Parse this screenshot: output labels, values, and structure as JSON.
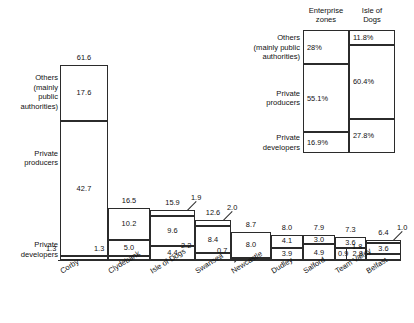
{
  "chart_data": {
    "type": "bar",
    "subtype": "stacked-bar-variable-width",
    "title": "",
    "xlabel": "",
    "ylabel": "",
    "grid": false,
    "legend_position": "top-right",
    "categories": [
      "Corby",
      "Clydebank",
      "Isle of Dogs",
      "Swansea",
      "Newcastle",
      "Dudley",
      "Salford",
      "Team Valley",
      "Belfast"
    ],
    "series": [
      {
        "name": "Others (mainly public authorities)",
        "values": [
          17.6,
          10.2,
          9.6,
          8.4,
          8.0,
          4.1,
          3.0,
          3.6,
          3.6
        ]
      },
      {
        "name": "Private producers",
        "values": [
          42.7,
          5.0,
          4.4,
          2.2,
          0.7,
          3.9,
          4.9,
          0.9,
          1.8
        ]
      },
      {
        "name": "Private developers",
        "values": [
          1.3,
          1.3,
          1.9,
          2.0,
          0.0,
          0.0,
          0.0,
          2.8,
          1.0
        ]
      }
    ],
    "totals": [
      61.6,
      16.5,
      15.9,
      12.6,
      8.7,
      8.0,
      7.9,
      7.3,
      6.4
    ],
    "ylim": [
      0,
      61.6
    ]
  },
  "row_labels": {
    "others": "Others\n(mainly\npublic\nauthorities)",
    "producers": "Private\nproducers",
    "developers": "Private\ndevelopers"
  },
  "bars": [
    {
      "name": "Corby",
      "total": "61.6",
      "segments": [
        {
          "key": "others",
          "label": "17.6",
          "value": 17.6,
          "inline": true
        },
        {
          "key": "producers",
          "label": "42.7",
          "value": 42.7,
          "inline": true
        },
        {
          "key": "developers",
          "label": "1.3",
          "value": 1.3,
          "inline": false
        }
      ]
    },
    {
      "name": "Clydebank",
      "total": "16.5",
      "segments": [
        {
          "key": "others",
          "label": "10.2",
          "value": 10.2,
          "inline": true
        },
        {
          "key": "producers",
          "label": "5.0",
          "value": 5.0,
          "inline": true
        },
        {
          "key": "developers",
          "label": "1.3",
          "value": 1.3,
          "inline": false
        }
      ]
    },
    {
      "name": "Isle of Dogs",
      "total": "15.9",
      "segments": [
        {
          "key": "developers",
          "label": "1.9",
          "value": 1.9,
          "inline": false
        },
        {
          "key": "others",
          "label": "9.6",
          "value": 9.6,
          "inline": true
        },
        {
          "key": "producers",
          "label": "4.4",
          "value": 4.4,
          "inline": true
        }
      ]
    },
    {
      "name": "Swansea",
      "total": "12.6",
      "segments": [
        {
          "key": "developers",
          "label": "2.0",
          "value": 2.0,
          "inline": false
        },
        {
          "key": "others",
          "label": "8.4",
          "value": 8.4,
          "inline": true
        },
        {
          "key": "producers",
          "label": "2.2",
          "value": 2.2,
          "inline": true
        }
      ]
    },
    {
      "name": "Newcastle",
      "total": "8.7",
      "segments": [
        {
          "key": "others",
          "label": "8.0",
          "value": 8.0,
          "inline": true
        },
        {
          "key": "producers",
          "label": "0.7",
          "value": 0.7,
          "inline": true
        }
      ]
    },
    {
      "name": "Dudley",
      "total": "8.0",
      "segments": [
        {
          "key": "others",
          "label": "4.1",
          "value": 4.1,
          "inline": true
        },
        {
          "key": "producers",
          "label": "3.9",
          "value": 3.9,
          "inline": true
        }
      ]
    },
    {
      "name": "Salford",
      "total": "7.9",
      "segments": [
        {
          "key": "others",
          "label": "3.0",
          "value": 3.0,
          "inline": true
        },
        {
          "key": "producers",
          "label": "4.9",
          "value": 4.9,
          "inline": true
        }
      ]
    },
    {
      "name": "Team Valley",
      "total": "7.3",
      "segments": [
        {
          "key": "others",
          "label": "3.6",
          "value": 3.6,
          "inline": true
        },
        {
          "key": "split",
          "label_left": "0.9",
          "label_right": "2.8",
          "value": 3.7,
          "inline": true
        }
      ]
    },
    {
      "name": "Belfast",
      "total": "6.4",
      "segments": [
        {
          "key": "developers",
          "label": "1.0",
          "value": 1.0,
          "inline": false
        },
        {
          "key": "others",
          "label": "3.6",
          "value": 3.6,
          "inline": true
        },
        {
          "key": "producers",
          "label": "1.8",
          "value": 1.8,
          "inline": true
        }
      ]
    }
  ],
  "legend": {
    "col_headers": [
      "Enterprise\nzones",
      "Isle of\nDogs"
    ],
    "rows": [
      {
        "label": "Others\n(mainly public\nauthorities)",
        "enterprise_zones": "28%",
        "isle_of_dogs": "11.8%"
      },
      {
        "label": "Private\nproducers",
        "enterprise_zones": "55.1%",
        "isle_of_dogs": "60.4%"
      },
      {
        "label": "Private\ndevelopers",
        "enterprise_zones": "16.9%",
        "isle_of_dogs": "27.8%"
      }
    ]
  }
}
